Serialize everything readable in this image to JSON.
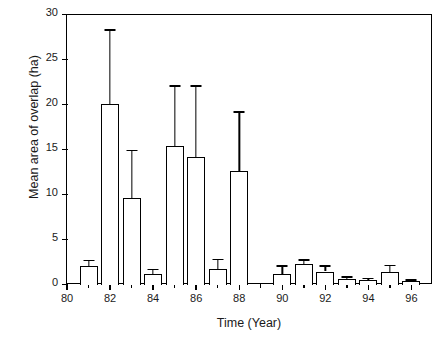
{
  "chart_data": {
    "type": "bar",
    "title": "",
    "xlabel": "Time (Year)",
    "ylabel": "Mean area of overlap (ha)",
    "xlim": [
      80,
      97
    ],
    "ylim": [
      0,
      30
    ],
    "grid": false,
    "legend": null,
    "error_bar_type": "upper-only",
    "x_ticks": [
      80,
      82,
      84,
      86,
      88,
      90,
      92,
      94,
      96
    ],
    "x_tick_labels": [
      "80",
      "82",
      "84",
      "86",
      "88",
      "90",
      "92",
      "94",
      "96"
    ],
    "x_minor_ticks": [
      81,
      83,
      85,
      87,
      89,
      91,
      93,
      95
    ],
    "y_ticks": [
      0,
      5,
      10,
      15,
      20,
      25,
      30
    ],
    "y_tick_labels": [
      "0",
      "5",
      "10",
      "15",
      "20",
      "25",
      "30"
    ],
    "categories": [
      "81",
      "82",
      "83",
      "84",
      "85",
      "86",
      "87",
      "88",
      "90",
      "91",
      "92",
      "93",
      "94",
      "95",
      "96"
    ],
    "x": [
      81,
      82,
      83,
      84,
      85,
      86,
      87,
      88,
      90,
      91,
      92,
      93,
      94,
      95,
      96
    ],
    "values": [
      2.1,
      20.1,
      9.7,
      1.25,
      15.4,
      14.2,
      1.8,
      12.7,
      1.2,
      2.35,
      1.5,
      0.7,
      0.55,
      1.5,
      0.45
    ],
    "errors_upper": [
      0.7,
      8.3,
      5.3,
      0.55,
      6.8,
      8.0,
      1.1,
      6.6,
      1.0,
      0.5,
      0.7,
      0.25,
      0.25,
      0.75,
      0.2
    ],
    "upper_limits": [
      2.8,
      28.4,
      15.0,
      1.8,
      22.2,
      22.2,
      2.9,
      19.3,
      2.2,
      2.85,
      2.2,
      0.95,
      0.8,
      2.25,
      0.65
    ]
  },
  "axes": {
    "y_title": "Mean area of overlap (ha)",
    "x_title": "Time (Year)"
  },
  "style": {
    "bar_fill": "#ffffff",
    "bar_stroke": "#000000",
    "axis_color": "#000000",
    "background": "#ffffff"
  }
}
